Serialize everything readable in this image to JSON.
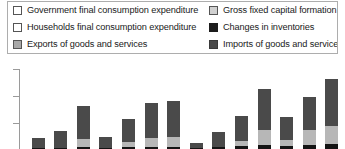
{
  "legend": {
    "items": [
      {
        "label": "Government final consumption expenditure",
        "swatch": "white",
        "color": "#ffffff",
        "column": "left",
        "row": 1
      },
      {
        "label": "Gross fixed capital formation",
        "swatch": "lightgray",
        "color": "#d0d0d0",
        "column": "right",
        "row": 1
      },
      {
        "label": "Households final consumption expenditure",
        "swatch": "white",
        "color": "#ffffff",
        "column": "left",
        "row": 2
      },
      {
        "label": "Changes in inventories",
        "swatch": "black",
        "color": "#1c1c1c",
        "column": "right",
        "row": 2
      },
      {
        "label": "Exports of goods and services",
        "swatch": "midgray",
        "color": "#a8a8a8",
        "column": "left",
        "row": 3
      },
      {
        "label": "Imports of goods and services",
        "swatch": "darkgray",
        "color": "#4a4a4a",
        "column": "right",
        "row": 3
      }
    ]
  },
  "chart_data": {
    "type": "bar",
    "subtype": "stacked",
    "title": "",
    "subtitle": "",
    "xlabel": "",
    "ylabel": "",
    "xticklabels": [],
    "yticklabels": [],
    "grid": false,
    "legend_position": "top",
    "note": "Chart is cropped: only the upper portion of the plot is visible; axis tick labels and x category labels fall outside the captured region.",
    "ylim": [
      0,
      100
    ],
    "axis": {
      "y_ticks_visible": 3,
      "y_tick_positions_px_from_top": [
        11,
        38,
        65
      ],
      "axis_color": "#9a9a9a"
    },
    "categories": [
      "1",
      "2",
      "3",
      "4",
      "5",
      "6",
      "7",
      "8",
      "9",
      "10",
      "11",
      "12",
      "13",
      "14"
    ],
    "series": [
      {
        "name": "Imports of goods and services",
        "color": "#4a4a4a",
        "values": [
          11,
          19,
          36,
          12,
          25,
          39,
          40,
          6,
          16,
          27,
          45,
          25,
          36,
          52
        ]
      },
      {
        "name": "Exports of goods and services",
        "color": "#b7b7b7",
        "values": [
          0,
          0,
          9,
          0,
          6,
          10,
          11,
          0,
          0,
          6,
          16,
          7,
          17,
          20
        ]
      },
      {
        "name": "Changes in inventories",
        "color": "#141414",
        "values": [
          1,
          1,
          2,
          1,
          2,
          2,
          2,
          1,
          2,
          3,
          4,
          3,
          4,
          5
        ]
      }
    ]
  }
}
